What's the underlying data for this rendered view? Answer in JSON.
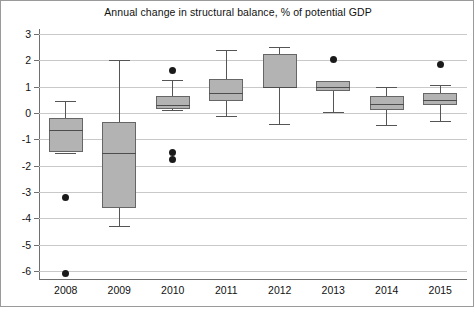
{
  "chart_data": {
    "type": "box",
    "title": "Annual change in structural balance, % of potential GDP",
    "xlabel": "",
    "ylabel": "",
    "ylim": [
      -6.5,
      3.5
    ],
    "yticks": [
      3,
      2,
      1,
      0,
      -1,
      -2,
      -3,
      -4,
      -5,
      -6
    ],
    "ytick_labels": [
      "3",
      "2",
      "1",
      "0",
      "-1",
      "-2",
      "-3",
      "-4",
      "-5",
      "-6"
    ],
    "grid": true,
    "legend": "none",
    "categories": [
      "2008",
      "2009",
      "2010",
      "2011",
      "2012",
      "2013",
      "2014",
      "2015"
    ],
    "boxes": [
      {
        "category": "2008",
        "whisker_low": -1.5,
        "q1": -1.5,
        "median": -0.65,
        "q3": -0.2,
        "whisker_high": 0.45,
        "outliers": [
          -3.2,
          -6.1
        ]
      },
      {
        "category": "2009",
        "whisker_low": -4.3,
        "q1": -3.6,
        "median": -1.5,
        "q3": -0.35,
        "whisker_high": 2.0,
        "outliers": []
      },
      {
        "category": "2010",
        "whisker_low": 0.1,
        "q1": 0.15,
        "median": 0.3,
        "q3": 0.65,
        "whisker_high": 1.25,
        "outliers": [
          1.6,
          -1.5,
          -1.75
        ]
      },
      {
        "category": "2011",
        "whisker_low": -0.1,
        "q1": 0.45,
        "median": 0.75,
        "q3": 1.3,
        "whisker_high": 2.4,
        "outliers": []
      },
      {
        "category": "2012",
        "whisker_low": -0.4,
        "q1": 0.95,
        "median": 1.0,
        "q3": 2.25,
        "whisker_high": 2.5,
        "outliers": []
      },
      {
        "category": "2013",
        "whisker_low": 0.05,
        "q1": 0.85,
        "median": 1.0,
        "q3": 1.2,
        "whisker_high": 1.2,
        "outliers": [
          2.05
        ]
      },
      {
        "category": "2014",
        "whisker_low": -0.45,
        "q1": 0.1,
        "median": 0.35,
        "q3": 0.65,
        "whisker_high": 1.0,
        "outliers": []
      },
      {
        "category": "2015",
        "whisker_low": -0.3,
        "q1": 0.3,
        "median": 0.5,
        "q3": 0.75,
        "whisker_high": 1.05,
        "outliers": [
          1.85
        ]
      }
    ],
    "colors": {
      "box_fill": "#b3b3b3",
      "box_edge": "#666666",
      "whisker": "#555555",
      "outlier": "#1a1a1a",
      "grid": "#c9c9c9",
      "axis": "#6f6f6f",
      "background": "#ffffff",
      "text": "#111111"
    }
  }
}
